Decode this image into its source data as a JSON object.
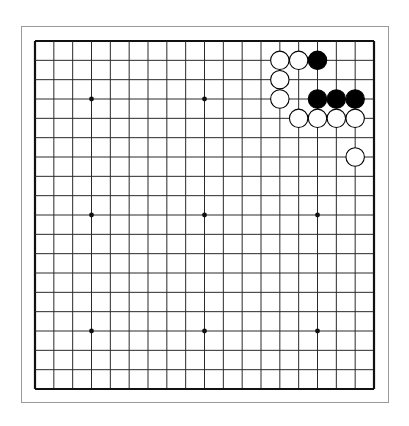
{
  "board": {
    "size": 19,
    "grid": {
      "left": 35,
      "top": 41,
      "right": 374,
      "bottom": 389
    },
    "line_color": "#2a2a2a",
    "border_color": "#111111",
    "star_points": [
      [
        3,
        3
      ],
      [
        3,
        9
      ],
      [
        3,
        15
      ],
      [
        9,
        3
      ],
      [
        9,
        9
      ],
      [
        9,
        15
      ],
      [
        15,
        3
      ],
      [
        15,
        9
      ],
      [
        15,
        15
      ]
    ],
    "stones": [
      {
        "color": "white",
        "col": 13,
        "row": 1
      },
      {
        "color": "white",
        "col": 14,
        "row": 1
      },
      {
        "color": "black",
        "col": 15,
        "row": 1
      },
      {
        "color": "white",
        "col": 13,
        "row": 2
      },
      {
        "color": "white",
        "col": 13,
        "row": 3
      },
      {
        "color": "black",
        "col": 15,
        "row": 3
      },
      {
        "color": "black",
        "col": 16,
        "row": 3
      },
      {
        "color": "black",
        "col": 17,
        "row": 3
      },
      {
        "color": "white",
        "col": 14,
        "row": 4
      },
      {
        "color": "white",
        "col": 15,
        "row": 4
      },
      {
        "color": "white",
        "col": 16,
        "row": 4
      },
      {
        "color": "white",
        "col": 17,
        "row": 4
      },
      {
        "color": "white",
        "col": 17,
        "row": 6
      }
    ],
    "stone_colors": {
      "black": "#000000",
      "white": "#ffffff"
    }
  }
}
